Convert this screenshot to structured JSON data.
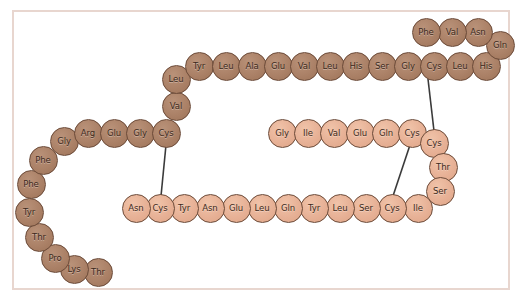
{
  "figure": {
    "width": 526,
    "height": 305,
    "background_color": "#ffffff",
    "frame_color": "#e8d6cf",
    "bond_color": "#3a3a3a",
    "residue_dark_color": "#ab8167",
    "residue_light_color": "#e7b196",
    "residue_outline_color": "#6b4a38",
    "label_color": "#3d2a20"
  },
  "residues": [
    {
      "label": "Thr",
      "x": 98,
      "y": 272,
      "shade": "dark"
    },
    {
      "label": "Lys",
      "x": 74,
      "y": 269,
      "shade": "dark"
    },
    {
      "label": "Pro",
      "x": 55,
      "y": 258,
      "shade": "dark"
    },
    {
      "label": "Thr",
      "x": 39,
      "y": 237,
      "shade": "dark"
    },
    {
      "label": "Tyr",
      "x": 29,
      "y": 212,
      "shade": "dark"
    },
    {
      "label": "Phe",
      "x": 31,
      "y": 184,
      "shade": "dark"
    },
    {
      "label": "Phe",
      "x": 43,
      "y": 160,
      "shade": "dark"
    },
    {
      "label": "Gly",
      "x": 64,
      "y": 141,
      "shade": "dark"
    },
    {
      "label": "Arg",
      "x": 88,
      "y": 133,
      "shade": "dark"
    },
    {
      "label": "Glu",
      "x": 114,
      "y": 133,
      "shade": "dark"
    },
    {
      "label": "Gly",
      "x": 140,
      "y": 133,
      "shade": "dark"
    },
    {
      "label": "Cys",
      "x": 166,
      "y": 133,
      "shade": "dark"
    },
    {
      "label": "Val",
      "x": 176,
      "y": 106,
      "shade": "dark"
    },
    {
      "label": "Leu",
      "x": 176,
      "y": 79,
      "shade": "dark"
    },
    {
      "label": "Tyr",
      "x": 199,
      "y": 66,
      "shade": "dark"
    },
    {
      "label": "Leu",
      "x": 226,
      "y": 66,
      "shade": "dark"
    },
    {
      "label": "Ala",
      "x": 252,
      "y": 66,
      "shade": "dark"
    },
    {
      "label": "Glu",
      "x": 278,
      "y": 66,
      "shade": "dark"
    },
    {
      "label": "Val",
      "x": 304,
      "y": 66,
      "shade": "dark"
    },
    {
      "label": "Leu",
      "x": 330,
      "y": 66,
      "shade": "dark"
    },
    {
      "label": "His",
      "x": 356,
      "y": 66,
      "shade": "dark"
    },
    {
      "label": "Ser",
      "x": 382,
      "y": 66,
      "shade": "dark"
    },
    {
      "label": "Gly",
      "x": 408,
      "y": 66,
      "shade": "dark"
    },
    {
      "label": "Cys",
      "x": 434,
      "y": 66,
      "shade": "dark"
    },
    {
      "label": "Leu",
      "x": 460,
      "y": 66,
      "shade": "dark"
    },
    {
      "label": "His",
      "x": 486,
      "y": 66,
      "shade": "dark"
    },
    {
      "label": "Gln",
      "x": 500,
      "y": 45,
      "shade": "dark"
    },
    {
      "label": "Asn",
      "x": 478,
      "y": 32,
      "shade": "dark"
    },
    {
      "label": "Val",
      "x": 452,
      "y": 32,
      "shade": "dark"
    },
    {
      "label": "Phe",
      "x": 426,
      "y": 32,
      "shade": "dark"
    },
    {
      "label": "Gly",
      "x": 282,
      "y": 133,
      "shade": "light"
    },
    {
      "label": "Ile",
      "x": 308,
      "y": 133,
      "shade": "light"
    },
    {
      "label": "Val",
      "x": 334,
      "y": 133,
      "shade": "light"
    },
    {
      "label": "Glu",
      "x": 360,
      "y": 133,
      "shade": "light"
    },
    {
      "label": "Gln",
      "x": 386,
      "y": 133,
      "shade": "light"
    },
    {
      "label": "Cys",
      "x": 412,
      "y": 133,
      "shade": "light"
    },
    {
      "label": "Cys",
      "x": 434,
      "y": 143,
      "shade": "light"
    },
    {
      "label": "Thr",
      "x": 443,
      "y": 167,
      "shade": "light"
    },
    {
      "label": "Ser",
      "x": 440,
      "y": 191,
      "shade": "light"
    },
    {
      "label": "Ile",
      "x": 418,
      "y": 208,
      "shade": "light"
    },
    {
      "label": "Cys",
      "x": 392,
      "y": 208,
      "shade": "light"
    },
    {
      "label": "Ser",
      "x": 366,
      "y": 208,
      "shade": "light"
    },
    {
      "label": "Leu",
      "x": 340,
      "y": 208,
      "shade": "light"
    },
    {
      "label": "Tyr",
      "x": 314,
      "y": 208,
      "shade": "light"
    },
    {
      "label": "Gln",
      "x": 288,
      "y": 208,
      "shade": "light"
    },
    {
      "label": "Leu",
      "x": 262,
      "y": 208,
      "shade": "light"
    },
    {
      "label": "Glu",
      "x": 236,
      "y": 208,
      "shade": "light"
    },
    {
      "label": "Asn",
      "x": 210,
      "y": 208,
      "shade": "light"
    },
    {
      "label": "Tyr",
      "x": 184,
      "y": 208,
      "shade": "light"
    },
    {
      "label": "Cys",
      "x": 160,
      "y": 208,
      "shade": "light"
    },
    {
      "label": "Asn",
      "x": 136,
      "y": 208,
      "shade": "light"
    }
  ],
  "bonds": [
    {
      "name": "disulfide-bond-left",
      "x1": 166,
      "y1": 145,
      "x2": 161,
      "y2": 196
    },
    {
      "name": "disulfide-bond-upper-right",
      "x1": 428,
      "y1": 79,
      "x2": 434,
      "y2": 131
    },
    {
      "name": "disulfide-bond-lower-right",
      "x1": 410,
      "y1": 145,
      "x2": 393,
      "y2": 196
    }
  ]
}
